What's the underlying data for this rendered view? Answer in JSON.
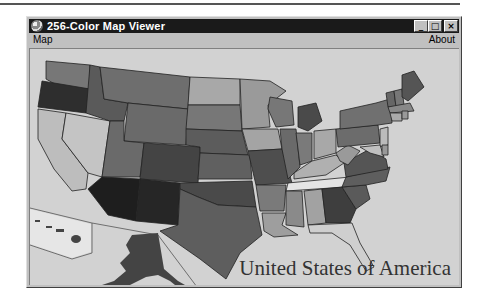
{
  "window": {
    "title": "256-Color Map Viewer",
    "icon": "globe-icon",
    "controls": {
      "minimize": "_",
      "maximize": "□",
      "close": "×"
    }
  },
  "menubar": {
    "items": [
      {
        "label": "Map"
      },
      {
        "label": "About"
      }
    ]
  },
  "map": {
    "caption": "United States of America",
    "background_color": "#d2d2d2",
    "insets": [
      "Hawaii",
      "Alaska"
    ]
  }
}
